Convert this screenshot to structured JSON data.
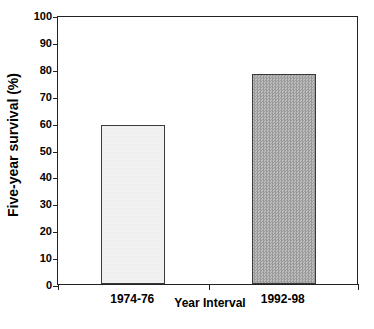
{
  "chart_data": {
    "type": "bar",
    "title": "",
    "subtitle": "",
    "xlabel": "Year Interval",
    "ylabel": "Five-year survival (%)",
    "categories": [
      "1974-76",
      "1992-98"
    ],
    "values": [
      59,
      78
    ],
    "series": [
      {
        "name": "Five-year survival",
        "values": [
          59,
          78
        ]
      }
    ],
    "ylim": [
      0,
      100
    ],
    "yticks": [
      0,
      10,
      20,
      30,
      40,
      50,
      60,
      70,
      80,
      90,
      100
    ],
    "ytick_labels": [
      "0",
      "10",
      "20",
      "30",
      "40",
      "50",
      "60",
      "70",
      "80",
      "90",
      "100"
    ],
    "grid": false,
    "legend": null,
    "legend_position": "none",
    "annotations": [],
    "bar_styles": [
      {
        "category": "1974-76",
        "fill": "#f2f2f2",
        "edge": "#3a3a3a",
        "pattern": "solid-light"
      },
      {
        "category": "1992-98",
        "fill": "#a8a8a8",
        "edge": "#3a3a3a",
        "pattern": "checkered-gray"
      }
    ],
    "colors": {
      "axis": "#222222",
      "text": "#000000",
      "background": "#ffffff",
      "bar_light": "#f2f2f2",
      "bar_dark": "#a8a8a8"
    }
  }
}
